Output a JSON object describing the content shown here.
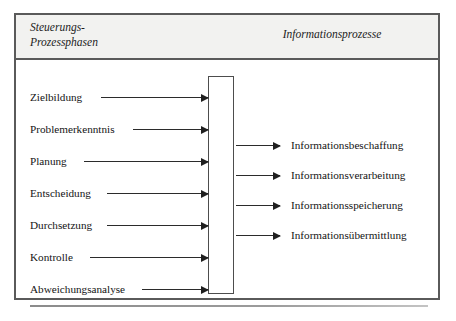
{
  "figure": {
    "header": {
      "left_title": "Steuerungs-\nProzessphasen",
      "right_title": "Informationsprozesse"
    },
    "central_box": {
      "label": ""
    },
    "phases": [
      {
        "label": "Zielbildung",
        "arrow_left": 85,
        "arrow_width": 107
      },
      {
        "label": "Problemerkenntnis",
        "arrow_left": 117,
        "arrow_width": 75
      },
      {
        "label": "Planung",
        "arrow_left": 68,
        "arrow_width": 124
      },
      {
        "label": "Entscheidung",
        "arrow_left": 91,
        "arrow_width": 101
      },
      {
        "label": "Durchsetzung",
        "arrow_left": 91,
        "arrow_width": 101
      },
      {
        "label": "Kontrolle",
        "arrow_left": 74,
        "arrow_width": 118
      },
      {
        "label": "Abweichungsanalyse",
        "arrow_left": 126,
        "arrow_width": 66
      }
    ],
    "information_processes": [
      {
        "label": "Informationsbeschaffung"
      },
      {
        "label": "Informationsverarbeitung"
      },
      {
        "label": "Informationsspeicherung"
      },
      {
        "label": "Informationsübermittlung"
      }
    ],
    "colors": {
      "frame_border": "#5a5a5a",
      "header_background": "#f2f2f0",
      "box_border": "#4d4d4d",
      "arrow": "#1f1f1f",
      "text": "#141414",
      "page_background": "#ffffff"
    }
  }
}
